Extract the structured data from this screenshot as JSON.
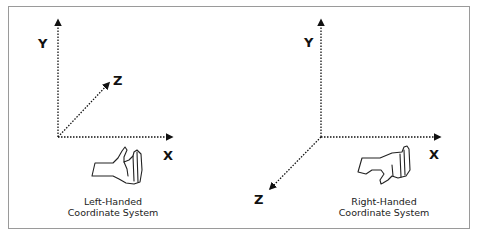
{
  "diagram": {
    "left": {
      "title_line1": "Left-Handed",
      "title_line2": "Coordinate System",
      "axes": {
        "x": "X",
        "y": "Y",
        "z": "Z"
      },
      "z_direction": "into-screen (up-right)",
      "hand_icon": "left-hand-icon"
    },
    "right": {
      "title_line1": "Right-Handed",
      "title_line2": "Coordinate System",
      "axes": {
        "x": "X",
        "y": "Y",
        "z": "Z"
      },
      "z_direction": "out-of-screen (down-left)",
      "hand_icon": "right-hand-icon"
    },
    "colors": {
      "axis": "#111111",
      "frame": "#9a9a9a",
      "text": "#222222"
    }
  }
}
